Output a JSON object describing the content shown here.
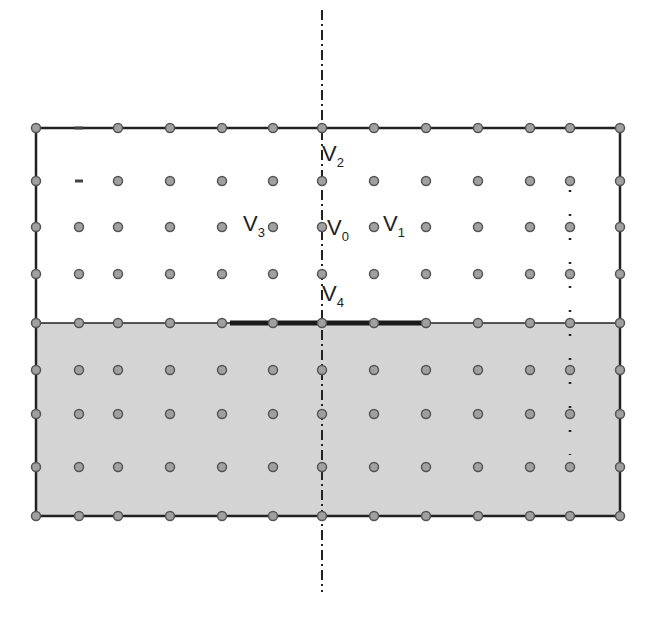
{
  "diagram": {
    "columns_x": [
      36,
      79,
      118,
      170,
      222,
      273,
      322,
      374,
      426,
      478,
      530,
      570,
      620
    ],
    "rows_y": [
      128,
      181,
      227,
      274,
      323,
      370,
      414,
      467,
      516
    ],
    "frame": {
      "left": 36,
      "top": 128,
      "right": 620,
      "bottom": 516
    },
    "shaded_region": {
      "top": 323,
      "bottom": 516,
      "color": "#d4d4d4"
    },
    "interface_line_y": 323,
    "thick_segment": {
      "x1": 230,
      "x2": 426,
      "y": 323
    },
    "symmetry_axis": {
      "x": 322,
      "y1": 10,
      "y2": 592
    },
    "dotted_line": {
      "x": 570,
      "y1": 190,
      "y2": 455
    },
    "colors": {
      "node_fill": "#a0a0a0",
      "node_stroke": "#555555",
      "line": "#222222",
      "shade": "#d4d4d4"
    },
    "labels": [
      {
        "id": "V2",
        "base": "V",
        "sub": "2",
        "x": 322,
        "y": 143
      },
      {
        "id": "V3",
        "base": "V",
        "sub": "3",
        "x": 243,
        "y": 213
      },
      {
        "id": "V0",
        "base": "V",
        "sub": "0",
        "x": 327,
        "y": 217
      },
      {
        "id": "V1",
        "base": "V",
        "sub": "1",
        "x": 383,
        "y": 213
      },
      {
        "id": "V4",
        "base": "V",
        "sub": "4",
        "x": 322,
        "y": 283
      }
    ]
  }
}
